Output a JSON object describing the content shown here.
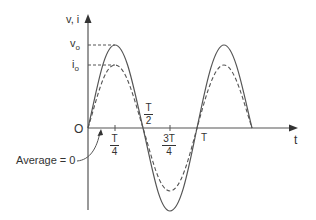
{
  "diagram": {
    "type": "waveform",
    "title": "",
    "y_axis_label": "v, i",
    "x_axis_label": "t",
    "origin_label": "O",
    "peak_labels": {
      "voltage": "v",
      "voltage_sub": "o",
      "current": "i",
      "current_sub": "o"
    },
    "ticks": [
      {
        "num": "T",
        "den": "4"
      },
      {
        "num": "T",
        "den": "2"
      },
      {
        "num": "3T",
        "den": "4"
      },
      {
        "label": "T"
      }
    ],
    "annotation": "Average = 0",
    "series": [
      {
        "name": "v",
        "style": "solid",
        "description": "voltage sinusoid, amplitude v0, one full period T plus a half cycle"
      },
      {
        "name": "i",
        "style": "dashed",
        "description": "current sinusoid in phase, amplitude i0 < v0"
      }
    ],
    "colors": {
      "line": "#555555",
      "text": "#333333",
      "background": "#ffffff"
    }
  }
}
